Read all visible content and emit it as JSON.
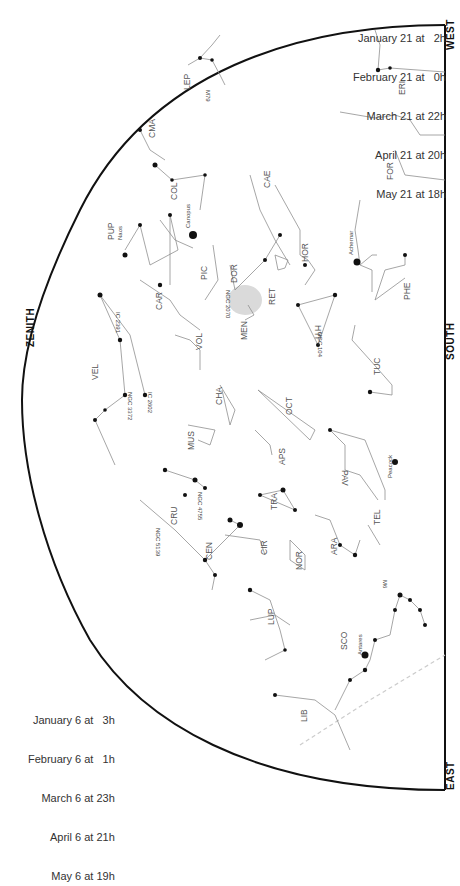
{
  "directions": {
    "zenith": "ZENITH",
    "south": "SOUTH",
    "west": "WEST",
    "east": "EAST"
  },
  "dates_right": [
    {
      "date": "January 21 at",
      "time": "2h"
    },
    {
      "date": "February 21 at",
      "time": "0h"
    },
    {
      "date": "March 21 at",
      "time": "22h"
    },
    {
      "date": "April 21 at",
      "time": "20h"
    },
    {
      "date": "May 21 at",
      "time": "18h"
    }
  ],
  "dates_left": [
    {
      "date": "January 6 at",
      "time": "3h"
    },
    {
      "date": "February 6 at",
      "time": "1h"
    },
    {
      "date": "March 6 at",
      "time": "23h"
    },
    {
      "date": "April 6 at",
      "time": "21h"
    },
    {
      "date": "May 6 at",
      "time": "19h"
    }
  ],
  "colors": {
    "background": "#ffffff",
    "horizon": "#111111",
    "constellation_lines": "#8a8a8a",
    "stars": "#111111",
    "labels": "#555555",
    "ecliptic": "#c8c8c8",
    "lmc": "#d6d6d6"
  },
  "constellations": [
    {
      "abbr": "ERI",
      "x": 405,
      "y": 95
    },
    {
      "abbr": "FOR",
      "x": 393,
      "y": 178
    },
    {
      "abbr": "PHE",
      "x": 410,
      "y": 290
    },
    {
      "abbr": "TUC",
      "x": 380,
      "y": 370
    },
    {
      "abbr": "CAE",
      "x": 270,
      "y": 180
    },
    {
      "abbr": "HOR",
      "x": 308,
      "y": 255
    },
    {
      "abbr": "RET",
      "x": 275,
      "y": 298
    },
    {
      "abbr": "HYI",
      "x": 315,
      "y": 318
    },
    {
      "abbr": "DOR",
      "x": 235,
      "y": 275
    },
    {
      "abbr": "PIC",
      "x": 205,
      "y": 272
    },
    {
      "abbr": "MEN",
      "x": 245,
      "y": 330
    },
    {
      "abbr": "COL",
      "x": 175,
      "y": 192
    },
    {
      "abbr": "CAR",
      "x": 160,
      "y": 300
    },
    {
      "abbr": "PUP",
      "x": 112,
      "y": 230
    },
    {
      "abbr": "LEP",
      "x": 190,
      "y": 80
    },
    {
      "abbr": "CMA",
      "x": 155,
      "y": 130
    },
    {
      "abbr": "VEL",
      "x": 96,
      "y": 370
    },
    {
      "abbr": "VOL",
      "x": 200,
      "y": 340
    },
    {
      "abbr": "CHA",
      "x": 220,
      "y": 395
    },
    {
      "abbr": "OCT",
      "x": 290,
      "y": 405
    },
    {
      "abbr": "MUS",
      "x": 192,
      "y": 440
    },
    {
      "abbr": "APS",
      "x": 283,
      "y": 455
    },
    {
      "abbr": "PAV",
      "x": 340,
      "y": 460
    },
    {
      "abbr": "CRU",
      "x": 175,
      "y": 515
    },
    {
      "abbr": "TRA",
      "x": 275,
      "y": 500
    },
    {
      "abbr": "CEN",
      "x": 210,
      "y": 550
    },
    {
      "abbr": "CIR",
      "x": 265,
      "y": 545
    },
    {
      "abbr": "NOR",
      "x": 300,
      "y": 560
    },
    {
      "abbr": "ARA",
      "x": 335,
      "y": 545
    },
    {
      "abbr": "TEL",
      "x": 378,
      "y": 515
    },
    {
      "abbr": "LUP",
      "x": 272,
      "y": 615
    },
    {
      "abbr": "SCO",
      "x": 345,
      "y": 640
    },
    {
      "abbr": "LIB",
      "x": 305,
      "y": 715
    }
  ],
  "named_objects": [
    {
      "name": "Canopus",
      "x": 193,
      "y": 235
    },
    {
      "name": "Naos",
      "x": 120,
      "y": 245
    },
    {
      "name": "Achernar",
      "x": 355,
      "y": 265
    },
    {
      "name": "Peacock",
      "x": 390,
      "y": 465
    },
    {
      "name": "Antares",
      "x": 360,
      "y": 655
    },
    {
      "name": "NGC 2070",
      "x": 228,
      "y": 300
    },
    {
      "name": "NGC 104",
      "x": 320,
      "y": 340
    },
    {
      "name": "IC 2391",
      "x": 118,
      "y": 320
    },
    {
      "name": "NGC 3372",
      "x": 130,
      "y": 400
    },
    {
      "name": "IC 2602",
      "x": 150,
      "y": 400
    },
    {
      "name": "NGC 4755",
      "x": 200,
      "y": 500
    },
    {
      "name": "NGC 5139",
      "x": 158,
      "y": 535
    },
    {
      "name": "M79",
      "x": 208,
      "y": 95
    },
    {
      "name": "M6",
      "x": 385,
      "y": 585
    }
  ]
}
